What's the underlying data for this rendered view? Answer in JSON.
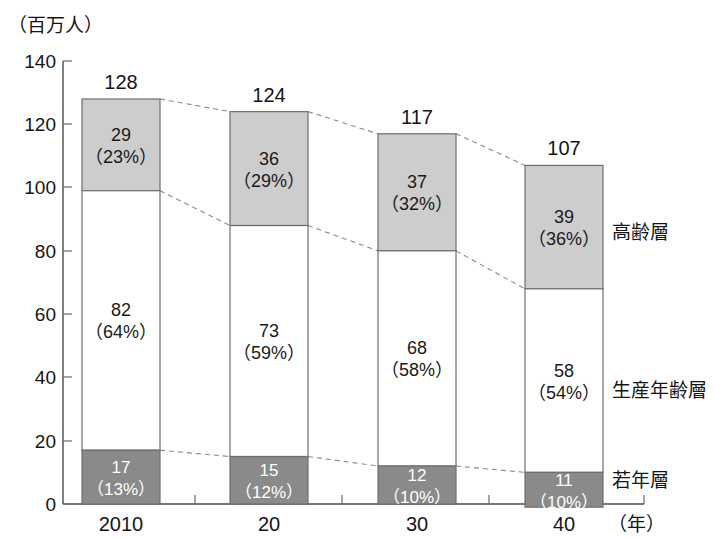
{
  "chart_data": {
    "type": "bar",
    "subtype": "stacked-bar",
    "title": "",
    "unit_label": "（百万人）",
    "xlabel": "（年）",
    "ylabel": "",
    "ylim": [
      0,
      140
    ],
    "ytick_step": 20,
    "yticks": [
      "0",
      "20",
      "40",
      "60",
      "80",
      "100",
      "120",
      "140"
    ],
    "categories": [
      "2010",
      "20",
      "30",
      "40"
    ],
    "totals": [
      128,
      124,
      117,
      107
    ],
    "total_labels": [
      "128",
      "124",
      "117",
      "107"
    ],
    "grid": false,
    "legend_position": "right",
    "series": [
      {
        "name": "高齢層",
        "legend_label": "高齢層",
        "color": "#cdcdcd",
        "text_color": "#1a1a1a",
        "values": [
          29,
          36,
          37,
          39
        ],
        "percents": [
          23,
          29,
          32,
          36
        ],
        "value_labels": [
          "29",
          "36",
          "37",
          "39"
        ],
        "percent_labels": [
          "（23%）",
          "（29%）",
          "（32%）",
          "（36%）"
        ]
      },
      {
        "name": "生産年齢層",
        "legend_label": "生産年齢層",
        "color": "#ffffff",
        "text_color": "#1a1a1a",
        "values": [
          82,
          73,
          68,
          58
        ],
        "percents": [
          64,
          59,
          58,
          54
        ],
        "value_labels": [
          "82",
          "73",
          "68",
          "58"
        ],
        "percent_labels": [
          "（64%）",
          "（59%）",
          "（58%）",
          "（54%）"
        ]
      },
      {
        "name": "若年層",
        "legend_label": "若年層",
        "color": "#8a8a8a",
        "text_color": "#ffffff",
        "values": [
          17,
          15,
          12,
          11
        ],
        "percents": [
          13,
          12,
          10,
          10
        ],
        "value_labels": [
          "17",
          "15",
          "12",
          "11"
        ],
        "percent_labels": [
          "（13%）",
          "（12%）",
          "（10%）",
          "（10%）"
        ]
      }
    ],
    "connectors": true
  },
  "axis": {
    "y_tick_140": "140",
    "y_tick_120": "120",
    "y_tick_100": "100",
    "y_tick_80": "80",
    "y_tick_60": "60",
    "y_tick_40": "40",
    "y_tick_20": "20",
    "y_tick_0": "0"
  }
}
